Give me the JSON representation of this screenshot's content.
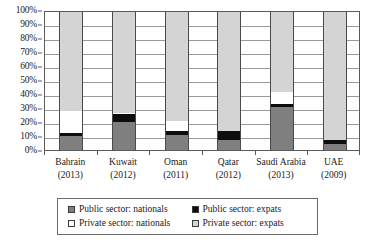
{
  "chart_data": {
    "type": "bar",
    "title": "",
    "subtitle": "",
    "xlabel": "",
    "ylabel": "",
    "ylim": [
      0,
      100
    ],
    "grid": true,
    "stacked": true,
    "stack_normalized": true,
    "legend_position": "bottom",
    "categories": [
      "Bahrain",
      "Kuwait",
      "Oman",
      "Qatar",
      "Saudi Arabia",
      "UAE"
    ],
    "category_years": [
      "(2013)",
      "(2012)",
      "(2011)",
      "(2012)",
      "(2013)",
      "(2009)"
    ],
    "ytick_labels": [
      "0%",
      "10%",
      "20%",
      "30%",
      "40%",
      "50%",
      "60%",
      "70%",
      "80%",
      "90%",
      "100%"
    ],
    "ytick_values": [
      0,
      10,
      20,
      30,
      40,
      50,
      60,
      70,
      80,
      90,
      100
    ],
    "series": [
      {
        "name": "Public sector: nationals",
        "color": "#7f7f7f",
        "values": [
          10,
          20,
          11,
          7,
          31,
          4
        ]
      },
      {
        "name": "Public sector: expats",
        "color": "#0d0d0d",
        "values": [
          2,
          6,
          3,
          7,
          2,
          3
        ]
      },
      {
        "name": "Private sector: nationals",
        "color": "#ffffff",
        "values": [
          16,
          1,
          7,
          0,
          9,
          0
        ]
      },
      {
        "name": "Private sector: expats",
        "color": "#d4d4d4",
        "values": [
          72,
          73,
          79,
          86,
          58,
          93
        ]
      }
    ]
  },
  "legend": {
    "items": [
      {
        "label": "Public sector: nationals",
        "swatch": "public-nationals-swatch"
      },
      {
        "label": "Public sector: expats",
        "swatch": "public-expats-swatch"
      },
      {
        "label": "Private sector: nationals",
        "swatch": "private-nationals-swatch"
      },
      {
        "label": "Private sector: expats",
        "swatch": "private-expats-swatch"
      }
    ]
  }
}
